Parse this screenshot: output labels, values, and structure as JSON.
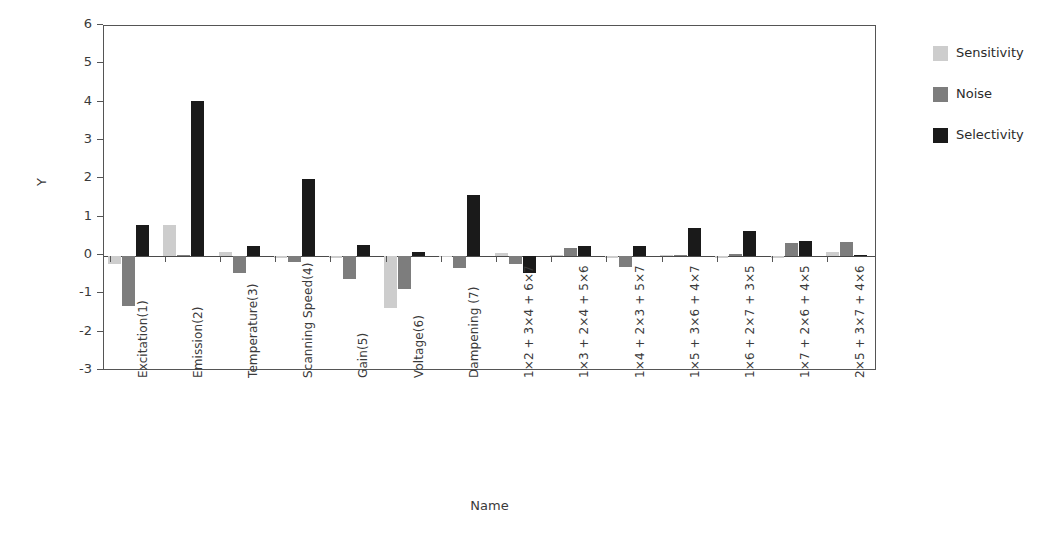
{
  "chart_data": {
    "type": "bar",
    "title": "",
    "xlabel": "Name",
    "ylabel": "Y",
    "ylim": [
      -3,
      6
    ],
    "yticks": [
      6,
      5,
      4,
      3,
      2,
      1,
      0,
      -1,
      -2,
      -3
    ],
    "ytick_labels": [
      "6",
      "5",
      "4",
      "3",
      "2",
      "1",
      "0",
      "-1",
      "-2",
      "-3"
    ],
    "grid": false,
    "legend_position": "right",
    "orientation": "vertical",
    "grouped": true,
    "categories": [
      "Excitation(1)",
      "Emission(2)",
      "Temperature(3)",
      "Scanning Speed(4)",
      "Gain(5)",
      "Voltage(6)",
      "Dampening (7)",
      "1×2 + 3×4 + 6×7",
      "1×3 + 2×4 + 5×6",
      "1×4 + 2×3 + 5×7",
      "1×5 + 3×6 + 4×7",
      "1×6 + 2×7 + 3×5",
      "1×7 + 2×6 + 4×5",
      "2×5 + 3×7 + 4×6"
    ],
    "series": [
      {
        "name": "Sensitivity",
        "color": "#cdcdcd",
        "values": [
          -0.2,
          0.8,
          0.1,
          -0.05,
          -0.05,
          -1.35,
          -0.02,
          0.07,
          0.01,
          -0.05,
          0.01,
          -0.06,
          -0.05,
          0.1
        ]
      },
      {
        "name": "Noise",
        "color": "#7d7d7d",
        "values": [
          -1.3,
          0.02,
          -0.45,
          -0.15,
          -0.6,
          -0.85,
          -0.3,
          -0.2,
          0.22,
          -0.28,
          0.02,
          0.04,
          0.33,
          0.37
        ]
      },
      {
        "name": "Selectivity",
        "color": "#1a1a1a",
        "values": [
          0.8,
          4.05,
          0.25,
          2.0,
          0.3,
          0.1,
          1.6,
          -0.45,
          0.25,
          0.25,
          0.72,
          0.66,
          0.4,
          0.03
        ]
      }
    ]
  },
  "legend": {
    "items": [
      {
        "label": "Sensitivity",
        "color": "#cdcdcd"
      },
      {
        "label": "Noise",
        "color": "#7d7d7d"
      },
      {
        "label": "Selectivity",
        "color": "#1a1a1a"
      }
    ]
  },
  "axes": {
    "y_title": "Y",
    "x_title": "Name"
  }
}
